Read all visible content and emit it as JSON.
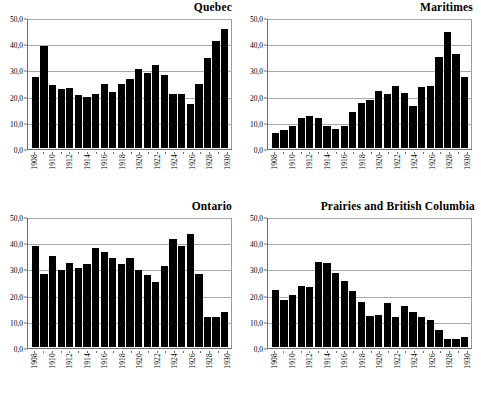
{
  "figure": {
    "panels": [
      {
        "id": "quebec",
        "title": "Quebec"
      },
      {
        "id": "maritimes",
        "title": "Maritimes"
      },
      {
        "id": "ontario",
        "title": "Ontario"
      },
      {
        "id": "prairies",
        "title": "Prairies and British Columbia"
      }
    ]
  },
  "axis": {
    "yticks": [
      "0,0",
      "10,0",
      "20,0",
      "30,0",
      "40,0",
      "50,0"
    ],
    "xticks": [
      "1908",
      "1910",
      "1912",
      "1914",
      "1916",
      "1918",
      "1920",
      "1922",
      "1924",
      "1926",
      "1928",
      "1930"
    ]
  },
  "chart_data": [
    {
      "type": "bar",
      "title": "Quebec",
      "xlabel": "",
      "ylabel": "",
      "ylim": [
        0,
        50
      ],
      "ytick_values": [
        0,
        10,
        20,
        30,
        40,
        50
      ],
      "ytick_labels": [
        "0,0",
        "10,0",
        "20,0",
        "30,0",
        "40,0",
        "50,0"
      ],
      "grid": true,
      "legend": "none",
      "categories": [
        1908,
        1909,
        1910,
        1911,
        1912,
        1913,
        1914,
        1915,
        1916,
        1917,
        1918,
        1919,
        1920,
        1921,
        1922,
        1923,
        1924,
        1925,
        1926,
        1927,
        1928,
        1929,
        1930
      ],
      "values": [
        27.3,
        39.2,
        24.2,
        22.8,
        23.1,
        20.5,
        19.6,
        20.6,
        24.7,
        21.6,
        24.7,
        26.5,
        30.5,
        29.0,
        32.0,
        28.0,
        20.9,
        20.9,
        16.9,
        24.7,
        34.7,
        41.2,
        45.7
      ]
    },
    {
      "type": "bar",
      "title": "Maritimes",
      "xlabel": "",
      "ylabel": "",
      "ylim": [
        0,
        50
      ],
      "ytick_values": [
        0,
        10,
        20,
        30,
        40,
        50
      ],
      "ytick_labels": [
        "0,0",
        "10,0",
        "20,0",
        "30,0",
        "40,0",
        "50,0"
      ],
      "grid": true,
      "legend": "none",
      "categories": [
        1908,
        1909,
        1910,
        1911,
        1912,
        1913,
        1914,
        1915,
        1916,
        1917,
        1918,
        1919,
        1920,
        1921,
        1922,
        1923,
        1924,
        1925,
        1926,
        1927,
        1928,
        1929,
        1930
      ],
      "values": [
        5.9,
        7.1,
        8.6,
        11.5,
        12.3,
        11.6,
        8.3,
        7.2,
        8.3,
        13.7,
        17.3,
        18.6,
        21.8,
        20.7,
        23.9,
        21.0,
        16.3,
        23.3,
        23.9,
        35.0,
        44.7,
        36.3,
        27.3
      ]
    },
    {
      "type": "bar",
      "title": "Ontario",
      "xlabel": "",
      "ylabel": "",
      "ylim": [
        0,
        50
      ],
      "ytick_values": [
        0,
        10,
        20,
        30,
        40,
        50
      ],
      "ytick_labels": [
        "0,0",
        "10,0",
        "20,0",
        "30,0",
        "40,0",
        "50,0"
      ],
      "grid": true,
      "legend": "none",
      "categories": [
        1908,
        1909,
        1910,
        1911,
        1912,
        1913,
        1914,
        1915,
        1916,
        1917,
        1918,
        1919,
        1920,
        1921,
        1922,
        1923,
        1924,
        1925,
        1926,
        1927,
        1928,
        1929,
        1930
      ],
      "values": [
        38.9,
        27.9,
        34.9,
        29.6,
        32.3,
        30.5,
        32.0,
        38.0,
        36.5,
        34.1,
        32.0,
        34.4,
        29.7,
        27.6,
        24.9,
        31.2,
        41.4,
        38.7,
        43.4,
        27.9,
        11.7,
        11.6,
        13.5
      ]
    },
    {
      "type": "bar",
      "title": "Prairies and British Columbia",
      "xlabel": "",
      "ylabel": "",
      "ylim": [
        0,
        50
      ],
      "ytick_values": [
        0,
        10,
        20,
        30,
        40,
        50
      ],
      "ytick_labels": [
        "0,0",
        "10,0",
        "20,0",
        "30,0",
        "40,0",
        "50,0"
      ],
      "grid": true,
      "legend": "none",
      "categories": [
        1908,
        1909,
        1910,
        1911,
        1912,
        1913,
        1914,
        1915,
        1916,
        1917,
        1918,
        1919,
        1920,
        1921,
        1922,
        1923,
        1924,
        1925,
        1926,
        1927,
        1928,
        1929,
        1930
      ],
      "values": [
        22.0,
        18.2,
        20.1,
        23.5,
        22.9,
        32.8,
        32.5,
        28.4,
        25.4,
        21.5,
        17.3,
        11.8,
        12.3,
        16.9,
        11.4,
        15.8,
        13.3,
        11.5,
        10.3,
        6.6,
        2.9,
        3.0,
        3.7
      ]
    }
  ],
  "style": {
    "bar_color": "#000000",
    "grid_color": "#a8a8a8",
    "axis_color": "#6e6e6e",
    "background": "#ffffff",
    "text_color": "#000000"
  }
}
